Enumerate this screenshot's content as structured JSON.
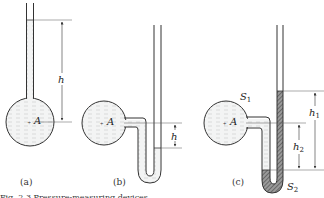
{
  "figure": {
    "panels": [
      {
        "id": "a",
        "caption": "(a)",
        "labels": {
          "point": "A",
          "height": "h"
        }
      },
      {
        "id": "b",
        "caption": "(b)",
        "labels": {
          "point": "A",
          "height": "h"
        }
      },
      {
        "id": "c",
        "caption": "(c)",
        "labels": {
          "point": "A",
          "surface1": "S",
          "surface1_sub": "1",
          "surface2": "S",
          "surface2_sub": "2",
          "height1": "h",
          "height1_sub": "1",
          "height2": "h",
          "height2_sub": "2"
        }
      }
    ],
    "caption_fragment": "Fig. 2.3  Pressure-measuring devices",
    "colors": {
      "line": "#333333",
      "liquid_fill": "#eef0f0",
      "liquid_dash": "#b9bfbf",
      "mercury_fill": "#7a7a7a"
    }
  }
}
